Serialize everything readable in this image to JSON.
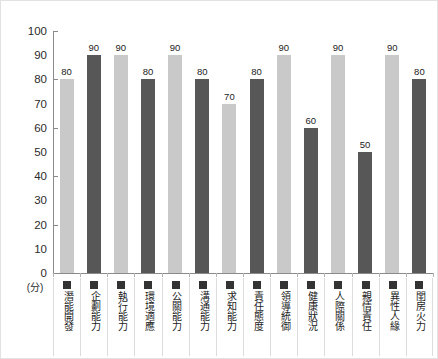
{
  "chart_data": {
    "type": "bar",
    "title": "",
    "subtitle": "",
    "xlabel": "",
    "ylabel": "(分)",
    "unit_label": "(分)",
    "ylim": [
      0,
      100
    ],
    "ytick_step": 10,
    "ytick_labels": [
      "100",
      "90",
      "80",
      "70",
      "60",
      "50",
      "40",
      "30",
      "20",
      "10",
      "0"
    ],
    "ytick_values": [
      100,
      90,
      80,
      70,
      60,
      50,
      40,
      30,
      20,
      10,
      0
    ],
    "major_ticks": [
      100,
      80,
      60,
      40,
      20,
      0
    ],
    "grid": false,
    "legend": "none",
    "categories": [
      "潛能開發",
      "企劃能力",
      "執行能力",
      "環境適應",
      "公關能力",
      "溝通能力",
      "求知能力",
      "責任態度",
      "領導統御",
      "健康狀況",
      "人際關係",
      "親情責任",
      "異性人緣",
      "閨房火力"
    ],
    "values": [
      80,
      90,
      90,
      80,
      90,
      80,
      70,
      80,
      90,
      60,
      90,
      50,
      90,
      80
    ],
    "bar_colors": [
      "#c9c9c9",
      "#575757",
      "#c9c9c9",
      "#575757",
      "#c9c9c9",
      "#575757",
      "#c9c9c9",
      "#575757",
      "#c9c9c9",
      "#575757",
      "#c9c9c9",
      "#575757",
      "#c9c9c9",
      "#575757"
    ],
    "swatch_colors": [
      "#333333",
      "#333333",
      "#333333",
      "#333333",
      "#333333",
      "#333333",
      "#333333",
      "#333333",
      "#333333",
      "#333333",
      "#333333",
      "#333333",
      "#333333",
      "#333333"
    ],
    "value_labels": [
      "80",
      "90",
      "90",
      "80",
      "90",
      "80",
      "70",
      "80",
      "90",
      "60",
      "90",
      "50",
      "90",
      "80"
    ],
    "colors": {
      "background": "#ffffff",
      "axis": "#8a8a8a",
      "text": "#1c1c1c",
      "bar_light": "#c9c9c9",
      "bar_dark": "#575757",
      "frame": "#e2e2e2",
      "separator": "#dcdcdc"
    }
  }
}
